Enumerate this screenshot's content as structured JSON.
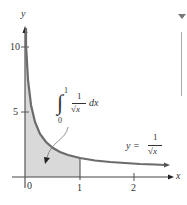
{
  "figure": {
    "type": "function-plot",
    "axes": {
      "x_label": "x",
      "y_label": "y",
      "x_ticks": [
        {
          "value": 0,
          "label": "0"
        },
        {
          "value": 1,
          "label": "1"
        },
        {
          "value": 2,
          "label": "2"
        }
      ],
      "y_ticks": [
        {
          "value": 5,
          "label": "5"
        },
        {
          "value": 10,
          "label": "10"
        }
      ]
    },
    "curve": {
      "label_lhs": "y =",
      "label_num": "1",
      "label_den": "√x",
      "equation": "y = 1/√x"
    },
    "shaded_region": {
      "from": 0,
      "to": 1,
      "integral_lower": "0",
      "integral_upper": "1",
      "integrand_num": "1",
      "integrand_den": "√x",
      "differential": "dx",
      "expression": "∫₀¹ 1/√x dx"
    },
    "colors": {
      "curve": "#6b6b6b",
      "shade": "#d9d9d9",
      "axis": "#444444",
      "scroll": "#aaaaaa"
    }
  },
  "scrollbar": {
    "arrow": "down-triangle"
  }
}
